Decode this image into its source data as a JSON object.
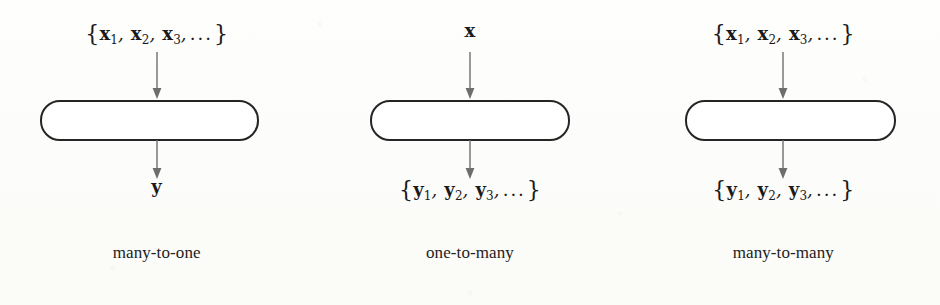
{
  "figure": {
    "background_color": "#fdfdfb",
    "box_border_color": "#252525",
    "arrow_color": "#6e6e6e",
    "text_color": "#1c1c1c"
  },
  "panels": [
    {
      "id": "many-to-one",
      "caption": "many-to-one",
      "input": {
        "open_brace": "{",
        "close_brace": "}",
        "items": [
          {
            "var": "x",
            "sub": "1"
          },
          {
            "var": "x",
            "sub": "2"
          },
          {
            "var": "x",
            "sub": "3"
          }
        ],
        "separator": ",",
        "ellipsis": "...",
        "plain": "{x1, x2, x3, ...}"
      },
      "output": {
        "open_brace": "",
        "close_brace": "",
        "items": [
          {
            "var": "y",
            "sub": ""
          }
        ],
        "separator": "",
        "ellipsis": "",
        "plain": "y"
      },
      "input_arrow": "arrow-down",
      "output_arrow": "arrow-down"
    },
    {
      "id": "one-to-many",
      "caption": "one-to-many",
      "input": {
        "open_brace": "",
        "close_brace": "",
        "items": [
          {
            "var": "x",
            "sub": ""
          }
        ],
        "separator": "",
        "ellipsis": "",
        "plain": "x"
      },
      "output": {
        "open_brace": "{",
        "close_brace": "}",
        "items": [
          {
            "var": "y",
            "sub": "1"
          },
          {
            "var": "y",
            "sub": "2"
          },
          {
            "var": "y",
            "sub": "3"
          }
        ],
        "separator": ",",
        "ellipsis": "...",
        "plain": "{y1, y2, y3, ...}"
      },
      "input_arrow": "arrow-down",
      "output_arrow": "arrow-down"
    },
    {
      "id": "many-to-many",
      "caption": "many-to-many",
      "input": {
        "open_brace": "{",
        "close_brace": "}",
        "items": [
          {
            "var": "x",
            "sub": "1"
          },
          {
            "var": "x",
            "sub": "2"
          },
          {
            "var": "x",
            "sub": "3"
          }
        ],
        "separator": ",",
        "ellipsis": "...",
        "plain": "{x1, x2, x3, ...}"
      },
      "output": {
        "open_brace": "{",
        "close_brace": "}",
        "items": [
          {
            "var": "y",
            "sub": "1"
          },
          {
            "var": "y",
            "sub": "2"
          },
          {
            "var": "y",
            "sub": "3"
          }
        ],
        "separator": ",",
        "ellipsis": "...",
        "plain": "{y1, y2, y3, ...}"
      },
      "input_arrow": "arrow-down",
      "output_arrow": "arrow-down"
    }
  ]
}
